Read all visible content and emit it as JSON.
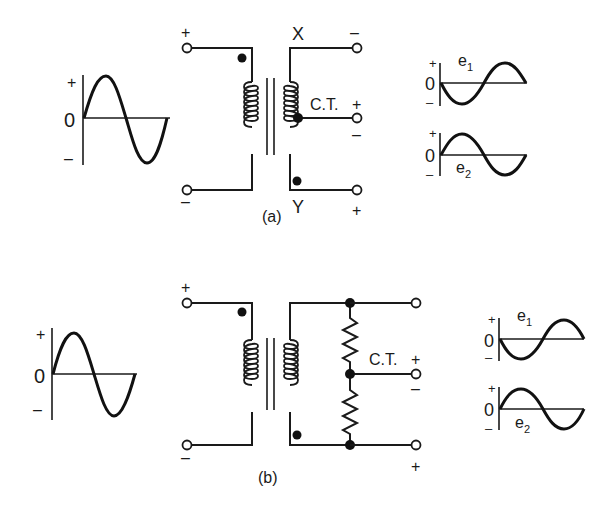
{
  "figure": {
    "panels": [
      {
        "id": "a",
        "caption": "(a)",
        "input_waveform": {
          "plus": "+",
          "zero": "0",
          "minus": "–"
        },
        "primary": {
          "top_polarity": "+",
          "bottom_polarity": "–"
        },
        "secondary": {
          "top_label": "X",
          "bottom_label": "Y",
          "top_polarity": "–",
          "ct_label": "C.T.",
          "ct_plus": "+",
          "ct_minus": "–",
          "bottom_polarity": "+"
        },
        "outputs": {
          "e1": {
            "name": "e",
            "sub": "1",
            "plus": "+",
            "zero": "0",
            "minus": "–"
          },
          "e2": {
            "name": "e",
            "sub": "2",
            "plus": "+",
            "zero": "0",
            "minus": "–"
          }
        }
      },
      {
        "id": "b",
        "caption": "(b)",
        "input_waveform": {
          "plus": "+",
          "zero": "0",
          "minus": "–"
        },
        "primary": {
          "top_polarity": "+",
          "bottom_polarity": "–"
        },
        "secondary": {
          "ct_label": "C.T.",
          "ct_plus": "+",
          "ct_minus": "–",
          "bottom_polarity": "+"
        },
        "outputs": {
          "e1": {
            "name": "e",
            "sub": "1",
            "plus": "+",
            "zero": "0",
            "minus": "–"
          },
          "e2": {
            "name": "e",
            "sub": "2",
            "plus": "+",
            "zero": "0",
            "minus": "–"
          }
        }
      }
    ]
  }
}
